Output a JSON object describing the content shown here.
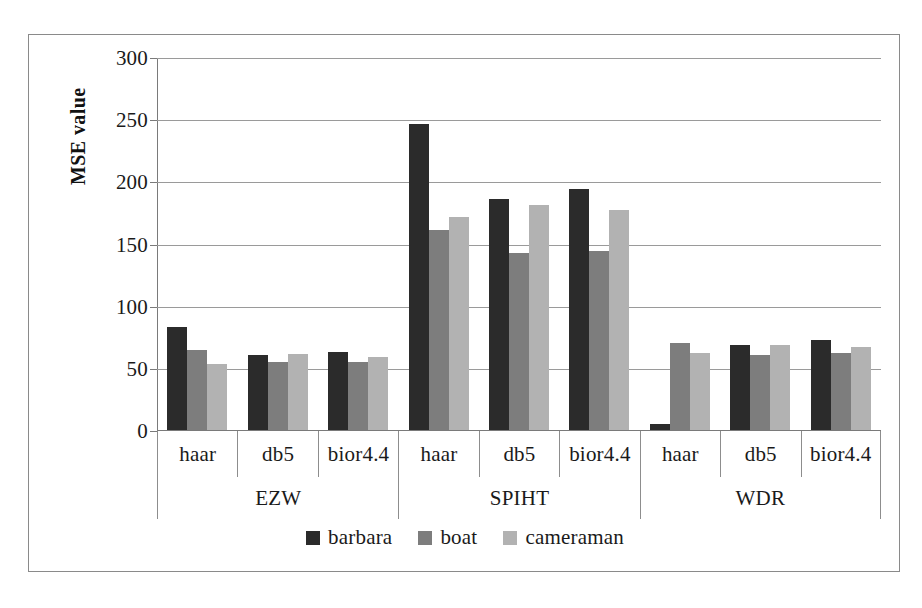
{
  "chart_data": {
    "type": "bar",
    "title": "",
    "xlabel": "",
    "ylabel": "MSE value",
    "ylim": [
      0,
      300
    ],
    "yticks": [
      0,
      50,
      100,
      150,
      200,
      250,
      300
    ],
    "ytick_labels": [
      "0",
      "50",
      "100",
      "150",
      "200",
      "250",
      "300"
    ],
    "grid": true,
    "legend_position": "bottom-center",
    "groups": [
      {
        "name": "EZW",
        "categories": [
          "haar",
          "db5",
          "bior4.4"
        ]
      },
      {
        "name": "SPIHT",
        "categories": [
          "haar",
          "db5",
          "bior4.4"
        ]
      },
      {
        "name": "WDR",
        "categories": [
          "haar",
          "db5",
          "bior4.4"
        ]
      }
    ],
    "categories": [
      "EZW / haar",
      "EZW / db5",
      "EZW / bior4.4",
      "SPIHT / haar",
      "SPIHT / db5",
      "SPIHT / bior4.4",
      "WDR / haar",
      "WDR / db5",
      "WDR / bior4.4"
    ],
    "series": [
      {
        "name": "barbara",
        "color": "#2b2b2b",
        "values": [
          83,
          60,
          63,
          246,
          186,
          194,
          5,
          68,
          72
        ]
      },
      {
        "name": "boat",
        "color": "#7d7d7d",
        "values": [
          64,
          55,
          55,
          161,
          142,
          144,
          70,
          60,
          62
        ]
      },
      {
        "name": "cameraman",
        "color": "#b2b2b2",
        "values": [
          53,
          61,
          59,
          171,
          181,
          177,
          62,
          68,
          67
        ]
      }
    ]
  },
  "axis": {
    "y_title": "MSE value"
  },
  "legend": {
    "items": [
      {
        "label": "barbara",
        "color": "#2b2b2b"
      },
      {
        "label": "boat",
        "color": "#7d7d7d"
      },
      {
        "label": "cameraman",
        "color": "#b2b2b2"
      }
    ]
  }
}
